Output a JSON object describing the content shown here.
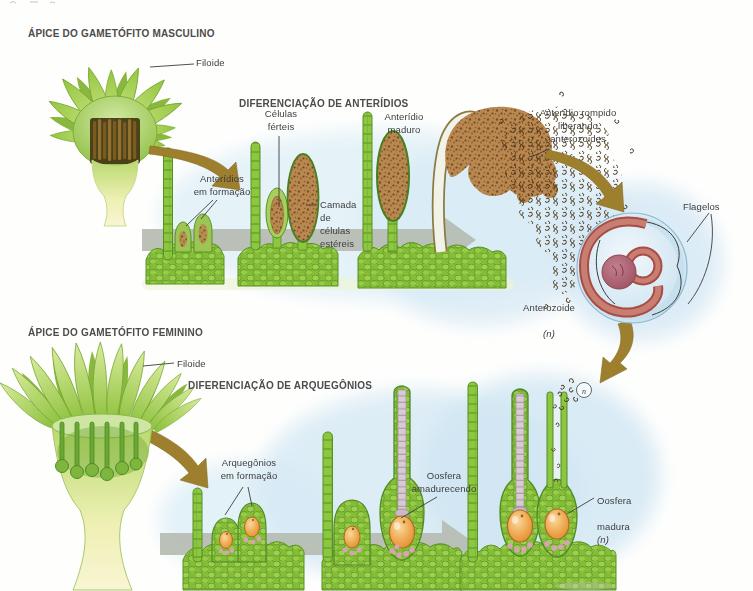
{
  "male": {
    "title": "ÁPICE DO GAMETÓFITO MASCULINO",
    "filoide": "Filoide",
    "seq_title": "DIFERENCIAÇÃO DE ANTERÍDIOS",
    "anteridios_formacao": "Anterídios\nem formação",
    "celulas_ferteis": "Células\nférteis",
    "camada": "Camada\nde\ncélulas\nestéreis",
    "maduro": "Anterídio\nmaduro",
    "rompido": "Anterídio rompido\nliberando\nanterozoides",
    "flagelos": "Flagelos",
    "anterozoide": "Anterozoide",
    "anterozoide_ploidy": "(n)"
  },
  "female": {
    "title": "ÁPICE DO GAMETÓFITO FEMININO",
    "filoide": "Filoide",
    "seq_title": "DIFERENCIAÇÃO DE ARQUEGÔNIOS",
    "arquegonios": "Arquegônios\nem formação",
    "amadurecendo": "Oosfera\namadurecendo",
    "madura_l1": "Oosfera",
    "madura_l2": "madura",
    "madura_ploidy": "(n)",
    "fert_n": "n"
  },
  "palette": {
    "moss_green": "#8dc63f",
    "cell_outline": "#569222",
    "leaf_light": "#d9eb9b",
    "antheridium_brown": "#b98851",
    "speckle_dark": "#6f471d",
    "flow_arrow_gray": "#b6bcb2",
    "transfer_arrow_brown": "#9d7f2e",
    "wash_blue": "#d9ebf5",
    "sperm_ball_blue": "#cfe5f1",
    "coil_red": "#a84c44",
    "nucleus_plum": "#9b4f5f",
    "egg_orange": "#eda44a",
    "neck_mauve": "#d9cbd4",
    "venter_pink": "#d9a3b4",
    "label_text": "#3d3d3d"
  }
}
